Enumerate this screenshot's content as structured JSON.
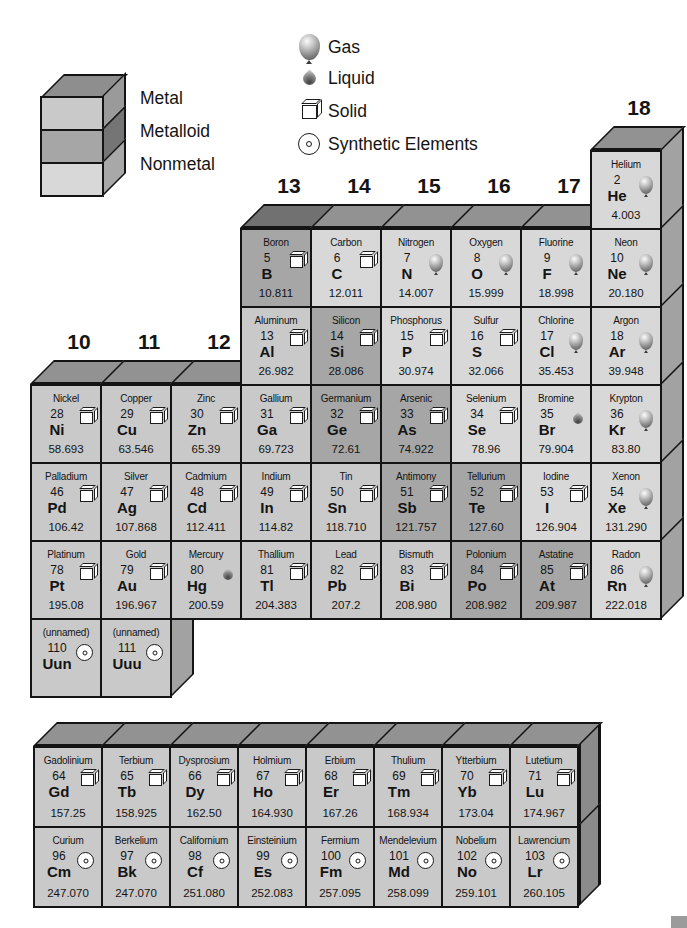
{
  "colors": {
    "metal": "#c9c9c9",
    "metalloid": "#a6a6a6",
    "nonmetal": "#d8d8d8",
    "top_face": "#929292",
    "top_face_metalloid": "#717171",
    "side_face": "#a2a2a2"
  },
  "legend_categories": {
    "items": [
      {
        "label": "Metal",
        "type": "metal"
      },
      {
        "label": "Metalloid",
        "type": "metalloid"
      },
      {
        "label": "Nonmetal",
        "type": "nonmetal"
      }
    ]
  },
  "legend_states": {
    "items": [
      {
        "label": "Gas",
        "icon": "gas-balloon-icon"
      },
      {
        "label": "Liquid",
        "icon": "liquid-drop-icon"
      },
      {
        "label": "Solid",
        "icon": "solid-cube-icon"
      },
      {
        "label": "Synthetic Elements",
        "icon": "synthetic-circle-icon"
      }
    ]
  },
  "group_headers": [
    {
      "label": "10",
      "col": 0,
      "row": 3
    },
    {
      "label": "11",
      "col": 1,
      "row": 3
    },
    {
      "label": "12",
      "col": 2,
      "row": 3
    },
    {
      "label": "13",
      "col": 3,
      "row": 1
    },
    {
      "label": "14",
      "col": 4,
      "row": 1
    },
    {
      "label": "15",
      "col": 5,
      "row": 1
    },
    {
      "label": "16",
      "col": 6,
      "row": 1
    },
    {
      "label": "17",
      "col": 7,
      "row": 1
    },
    {
      "label": "18",
      "col": 8,
      "row": 0
    }
  ],
  "main_table": {
    "rows": [
      {
        "cells": [
          {
            "col": 8,
            "name": "Helium",
            "num": "2",
            "sym": "He",
            "mass": "4.003",
            "cat": "nonmetal",
            "state": "gas"
          }
        ]
      },
      {
        "cells": [
          {
            "col": 3,
            "name": "Boron",
            "num": "5",
            "sym": "B",
            "mass": "10.811",
            "cat": "metalloid",
            "state": "solid"
          },
          {
            "col": 4,
            "name": "Carbon",
            "num": "6",
            "sym": "C",
            "mass": "12.011",
            "cat": "nonmetal",
            "state": "solid"
          },
          {
            "col": 5,
            "name": "Nitrogen",
            "num": "7",
            "sym": "N",
            "mass": "14.007",
            "cat": "nonmetal",
            "state": "gas"
          },
          {
            "col": 6,
            "name": "Oxygen",
            "num": "8",
            "sym": "O",
            "mass": "15.999",
            "cat": "nonmetal",
            "state": "gas"
          },
          {
            "col": 7,
            "name": "Fluorine",
            "num": "9",
            "sym": "F",
            "mass": "18.998",
            "cat": "nonmetal",
            "state": "gas"
          },
          {
            "col": 8,
            "name": "Neon",
            "num": "10",
            "sym": "Ne",
            "mass": "20.180",
            "cat": "nonmetal",
            "state": "gas"
          }
        ]
      },
      {
        "cells": [
          {
            "col": 3,
            "name": "Aluminum",
            "num": "13",
            "sym": "Al",
            "mass": "26.982",
            "cat": "metal",
            "state": "solid"
          },
          {
            "col": 4,
            "name": "Silicon",
            "num": "14",
            "sym": "Si",
            "mass": "28.086",
            "cat": "metalloid",
            "state": "solid"
          },
          {
            "col": 5,
            "name": "Phosphorus",
            "num": "15",
            "sym": "P",
            "mass": "30.974",
            "cat": "nonmetal",
            "state": "solid"
          },
          {
            "col": 6,
            "name": "Sulfur",
            "num": "16",
            "sym": "S",
            "mass": "32.066",
            "cat": "nonmetal",
            "state": "solid"
          },
          {
            "col": 7,
            "name": "Chlorine",
            "num": "17",
            "sym": "Cl",
            "mass": "35.453",
            "cat": "nonmetal",
            "state": "gas"
          },
          {
            "col": 8,
            "name": "Argon",
            "num": "18",
            "sym": "Ar",
            "mass": "39.948",
            "cat": "nonmetal",
            "state": "gas"
          }
        ]
      },
      {
        "cells": [
          {
            "col": 0,
            "name": "Nickel",
            "num": "28",
            "sym": "Ni",
            "mass": "58.693",
            "cat": "metal",
            "state": "solid"
          },
          {
            "col": 1,
            "name": "Copper",
            "num": "29",
            "sym": "Cu",
            "mass": "63.546",
            "cat": "metal",
            "state": "solid"
          },
          {
            "col": 2,
            "name": "Zinc",
            "num": "30",
            "sym": "Zn",
            "mass": "65.39",
            "cat": "metal",
            "state": "solid"
          },
          {
            "col": 3,
            "name": "Gallium",
            "num": "31",
            "sym": "Ga",
            "mass": "69.723",
            "cat": "metal",
            "state": "solid"
          },
          {
            "col": 4,
            "name": "Germanium",
            "num": "32",
            "sym": "Ge",
            "mass": "72.61",
            "cat": "metalloid",
            "state": "solid"
          },
          {
            "col": 5,
            "name": "Arsenic",
            "num": "33",
            "sym": "As",
            "mass": "74.922",
            "cat": "metalloid",
            "state": "solid"
          },
          {
            "col": 6,
            "name": "Selenium",
            "num": "34",
            "sym": "Se",
            "mass": "78.96",
            "cat": "nonmetal",
            "state": "solid"
          },
          {
            "col": 7,
            "name": "Bromine",
            "num": "35",
            "sym": "Br",
            "mass": "79.904",
            "cat": "nonmetal",
            "state": "liquid"
          },
          {
            "col": 8,
            "name": "Krypton",
            "num": "36",
            "sym": "Kr",
            "mass": "83.80",
            "cat": "nonmetal",
            "state": "gas"
          }
        ]
      },
      {
        "cells": [
          {
            "col": 0,
            "name": "Palladium",
            "num": "46",
            "sym": "Pd",
            "mass": "106.42",
            "cat": "metal",
            "state": "solid"
          },
          {
            "col": 1,
            "name": "Silver",
            "num": "47",
            "sym": "Ag",
            "mass": "107.868",
            "cat": "metal",
            "state": "solid"
          },
          {
            "col": 2,
            "name": "Cadmium",
            "num": "48",
            "sym": "Cd",
            "mass": "112.411",
            "cat": "metal",
            "state": "solid"
          },
          {
            "col": 3,
            "name": "Indium",
            "num": "49",
            "sym": "In",
            "mass": "114.82",
            "cat": "metal",
            "state": "solid"
          },
          {
            "col": 4,
            "name": "Tin",
            "num": "50",
            "sym": "Sn",
            "mass": "118.710",
            "cat": "metal",
            "state": "solid"
          },
          {
            "col": 5,
            "name": "Antimony",
            "num": "51",
            "sym": "Sb",
            "mass": "121.757",
            "cat": "metalloid",
            "state": "solid"
          },
          {
            "col": 6,
            "name": "Tellurium",
            "num": "52",
            "sym": "Te",
            "mass": "127.60",
            "cat": "metalloid",
            "state": "solid"
          },
          {
            "col": 7,
            "name": "Iodine",
            "num": "53",
            "sym": "I",
            "mass": "126.904",
            "cat": "nonmetal",
            "state": "solid"
          },
          {
            "col": 8,
            "name": "Xenon",
            "num": "54",
            "sym": "Xe",
            "mass": "131.290",
            "cat": "nonmetal",
            "state": "gas"
          }
        ]
      },
      {
        "cells": [
          {
            "col": 0,
            "name": "Platinum",
            "num": "78",
            "sym": "Pt",
            "mass": "195.08",
            "cat": "metal",
            "state": "solid"
          },
          {
            "col": 1,
            "name": "Gold",
            "num": "79",
            "sym": "Au",
            "mass": "196.967",
            "cat": "metal",
            "state": "solid"
          },
          {
            "col": 2,
            "name": "Mercury",
            "num": "80",
            "sym": "Hg",
            "mass": "200.59",
            "cat": "metal",
            "state": "liquid"
          },
          {
            "col": 3,
            "name": "Thallium",
            "num": "81",
            "sym": "Tl",
            "mass": "204.383",
            "cat": "metal",
            "state": "solid"
          },
          {
            "col": 4,
            "name": "Lead",
            "num": "82",
            "sym": "Pb",
            "mass": "207.2",
            "cat": "metal",
            "state": "solid"
          },
          {
            "col": 5,
            "name": "Bismuth",
            "num": "83",
            "sym": "Bi",
            "mass": "208.980",
            "cat": "metal",
            "state": "solid"
          },
          {
            "col": 6,
            "name": "Polonium",
            "num": "84",
            "sym": "Po",
            "mass": "208.982",
            "cat": "metalloid",
            "state": "solid"
          },
          {
            "col": 7,
            "name": "Astatine",
            "num": "85",
            "sym": "At",
            "mass": "209.987",
            "cat": "metalloid",
            "state": "solid"
          },
          {
            "col": 8,
            "name": "Radon",
            "num": "86",
            "sym": "Rn",
            "mass": "222.018",
            "cat": "nonmetal",
            "state": "gas"
          }
        ]
      },
      {
        "cells": [
          {
            "col": 0,
            "name": "(unnamed)",
            "num": "110",
            "sym": "Uun",
            "mass": "",
            "cat": "metal",
            "state": "synthetic"
          },
          {
            "col": 1,
            "name": "(unnamed)",
            "num": "111",
            "sym": "Uuu",
            "mass": "",
            "cat": "metal",
            "state": "synthetic"
          }
        ]
      }
    ]
  },
  "bottom_table": {
    "rows": [
      {
        "cells": [
          {
            "col": 0,
            "name": "Gadolinium",
            "num": "64",
            "sym": "Gd",
            "mass": "157.25",
            "cat": "metal",
            "state": "solid"
          },
          {
            "col": 1,
            "name": "Terbium",
            "num": "65",
            "sym": "Tb",
            "mass": "158.925",
            "cat": "metal",
            "state": "solid"
          },
          {
            "col": 2,
            "name": "Dysprosium",
            "num": "66",
            "sym": "Dy",
            "mass": "162.50",
            "cat": "metal",
            "state": "solid"
          },
          {
            "col": 3,
            "name": "Holmium",
            "num": "67",
            "sym": "Ho",
            "mass": "164.930",
            "cat": "metal",
            "state": "solid"
          },
          {
            "col": 4,
            "name": "Erbium",
            "num": "68",
            "sym": "Er",
            "mass": "167.26",
            "cat": "metal",
            "state": "solid"
          },
          {
            "col": 5,
            "name": "Thulium",
            "num": "69",
            "sym": "Tm",
            "mass": "168.934",
            "cat": "metal",
            "state": "solid"
          },
          {
            "col": 6,
            "name": "Ytterbium",
            "num": "70",
            "sym": "Yb",
            "mass": "173.04",
            "cat": "metal",
            "state": "solid"
          },
          {
            "col": 7,
            "name": "Lutetium",
            "num": "71",
            "sym": "Lu",
            "mass": "174.967",
            "cat": "metal",
            "state": "solid"
          }
        ]
      },
      {
        "cells": [
          {
            "col": 0,
            "name": "Curium",
            "num": "96",
            "sym": "Cm",
            "mass": "247.070",
            "cat": "metal",
            "state": "synthetic"
          },
          {
            "col": 1,
            "name": "Berkelium",
            "num": "97",
            "sym": "Bk",
            "mass": "247.070",
            "cat": "metal",
            "state": "synthetic"
          },
          {
            "col": 2,
            "name": "Californium",
            "num": "98",
            "sym": "Cf",
            "mass": "251.080",
            "cat": "metal",
            "state": "synthetic"
          },
          {
            "col": 3,
            "name": "Einsteinium",
            "num": "99",
            "sym": "Es",
            "mass": "252.083",
            "cat": "metal",
            "state": "synthetic"
          },
          {
            "col": 4,
            "name": "Fermium",
            "num": "100",
            "sym": "Fm",
            "mass": "257.095",
            "cat": "metal",
            "state": "synthetic"
          },
          {
            "col": 5,
            "name": "Mendelevium",
            "num": "101",
            "sym": "Md",
            "mass": "258.099",
            "cat": "metal",
            "state": "synthetic"
          },
          {
            "col": 6,
            "name": "Nobelium",
            "num": "102",
            "sym": "No",
            "mass": "259.101",
            "cat": "metal",
            "state": "synthetic"
          },
          {
            "col": 7,
            "name": "Lawrencium",
            "num": "103",
            "sym": "Lr",
            "mass": "260.105",
            "cat": "metal",
            "state": "synthetic"
          }
        ]
      }
    ]
  }
}
